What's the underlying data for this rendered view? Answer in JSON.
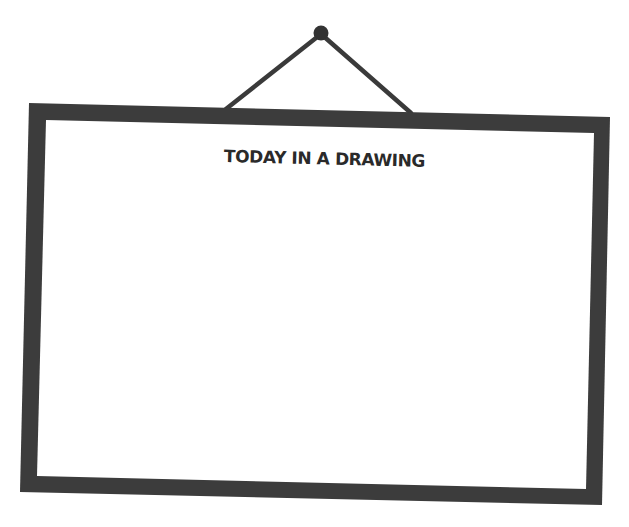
{
  "frame": {
    "title": "TODAY IN A DRAWING",
    "border_color": "#3c3c3c",
    "canvas_color": "#ffffff",
    "string_color": "#3a3a3a",
    "nail_color": "#333333"
  }
}
